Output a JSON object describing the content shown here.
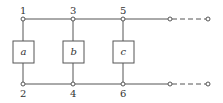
{
  "diagram": {
    "type": "ladder-network",
    "nodes": [
      {
        "id": "1",
        "label": "1",
        "x": 23,
        "y": 19
      },
      {
        "id": "3",
        "label": "3",
        "x": 73,
        "y": 19
      },
      {
        "id": "5",
        "label": "5",
        "x": 123,
        "y": 19
      },
      {
        "id": "2",
        "label": "2",
        "x": 23,
        "y": 84
      },
      {
        "id": "4",
        "label": "4",
        "x": 73,
        "y": 84
      },
      {
        "id": "6",
        "label": "6",
        "x": 123,
        "y": 84
      }
    ],
    "elements": [
      {
        "id": "a",
        "label": "a",
        "between": [
          "1",
          "2"
        ]
      },
      {
        "id": "b",
        "label": "b",
        "between": [
          "3",
          "4"
        ]
      },
      {
        "id": "c",
        "label": "c",
        "between": [
          "5",
          "6"
        ]
      }
    ],
    "continuation": "dashed lines to open terminals on top and bottom rails",
    "colors": {
      "line": "#555555",
      "text": "#333333"
    }
  }
}
